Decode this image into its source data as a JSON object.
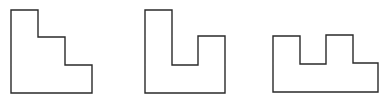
{
  "figure": {
    "stroke_color": "#2a2a2a",
    "background_color": "#ffffff",
    "shapes": [
      {
        "id": "staircase-shape",
        "label": "",
        "points": "11,10 38,10 38,37 65,37 65,65 92,65 92,93 11,93"
      },
      {
        "id": "u-notch-shape",
        "label": "",
        "points": "145,10 172,10 172,65 198,65 198,36 225,36 225,93 145,93"
      },
      {
        "id": "double-tab-shape",
        "label": "",
        "points": "273,36 300,36 300,64 326,64 326,35 353,35 353,63 378,63 378,92 273,92"
      }
    ]
  }
}
